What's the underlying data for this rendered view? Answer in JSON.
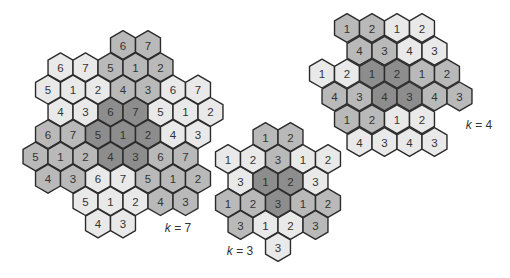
{
  "colors": {
    "light": "#e9e9e9",
    "medium": "#b9b9b9",
    "dark": "#8d8d8d",
    "stroke": "#2b2b2b",
    "text": "#333333"
  },
  "clusters": [
    {
      "id": "k7",
      "label": {
        "var": "k",
        "text": " = 7",
        "x": 178,
        "y": 228
      },
      "grid": {
        "x0": 48,
        "y0": 45,
        "dx": 25,
        "dy": 22.3
      },
      "rows": [
        {
          "c0": 3,
          "cells": [
            [
              "6",
              "medium"
            ],
            [
              "7",
              "medium"
            ]
          ]
        },
        {
          "c0": 0,
          "cells": [
            [
              "6",
              "light"
            ],
            [
              "7",
              "light"
            ],
            [
              "5",
              "medium"
            ],
            [
              "1",
              "medium"
            ],
            [
              "2",
              "medium"
            ]
          ]
        },
        {
          "c0": 0,
          "cells": [
            [
              "5",
              "light"
            ],
            [
              "1",
              "light"
            ],
            [
              "2",
              "light"
            ],
            [
              "4",
              "medium"
            ],
            [
              "3",
              "medium"
            ],
            [
              "6",
              "light"
            ],
            [
              "7",
              "light"
            ]
          ]
        },
        {
          "c0": 0,
          "cells": [
            [
              "4",
              "light"
            ],
            [
              "3",
              "light"
            ],
            [
              "6",
              "dark"
            ],
            [
              "7",
              "dark"
            ],
            [
              "5",
              "light"
            ],
            [
              "1",
              "light"
            ],
            [
              "2",
              "light"
            ]
          ]
        },
        {
          "c0": 0,
          "cells": [
            [
              "6",
              "medium"
            ],
            [
              "7",
              "medium"
            ],
            [
              "5",
              "dark"
            ],
            [
              "1",
              "dark"
            ],
            [
              "2",
              "dark"
            ],
            [
              "4",
              "light"
            ],
            [
              "3",
              "light"
            ]
          ]
        },
        {
          "c0": -1,
          "cells": [
            [
              "5",
              "medium"
            ],
            [
              "1",
              "medium"
            ],
            [
              "2",
              "medium"
            ],
            [
              "4",
              "dark"
            ],
            [
              "3",
              "dark"
            ],
            [
              "6",
              "medium"
            ],
            [
              "7",
              "medium"
            ]
          ]
        },
        {
          "c0": 0,
          "cells": [
            [
              "4",
              "medium"
            ],
            [
              "3",
              "medium"
            ],
            [
              "6",
              "light"
            ],
            [
              "7",
              "light"
            ],
            [
              "5",
              "medium"
            ],
            [
              "1",
              "medium"
            ],
            [
              "2",
              "medium"
            ]
          ]
        },
        {
          "c0": 1,
          "cells": [
            [
              "5",
              "light"
            ],
            [
              "1",
              "light"
            ],
            [
              "2",
              "light"
            ],
            [
              "4",
              "medium"
            ],
            [
              "3",
              "medium"
            ]
          ]
        },
        {
          "c0": 2,
          "cells": [
            [
              "4",
              "light"
            ],
            [
              "3",
              "light"
            ]
          ]
        }
      ]
    },
    {
      "id": "k3",
      "label": {
        "var": "k",
        "text": " = 3",
        "x": 240,
        "y": 251
      },
      "grid": {
        "x0": 228,
        "y0": 137,
        "dx": 25,
        "dy": 22
      },
      "rows": [
        {
          "c0": 1,
          "cells": [
            [
              "1",
              "medium"
            ],
            [
              "2",
              "medium"
            ]
          ]
        },
        {
          "c0": 0,
          "cells": [
            [
              "1",
              "light"
            ],
            [
              "2",
              "light"
            ],
            [
              "3",
              "medium"
            ],
            [
              "1",
              "light"
            ],
            [
              "2",
              "light"
            ]
          ]
        },
        {
          "c0": 0,
          "cells": [
            [
              "3",
              "light"
            ],
            [
              "1",
              "dark"
            ],
            [
              "2",
              "dark"
            ],
            [
              "3",
              "light"
            ]
          ]
        },
        {
          "c0": 0,
          "cells": [
            [
              "1",
              "medium"
            ],
            [
              "2",
              "medium"
            ],
            [
              "3",
              "dark"
            ],
            [
              "1",
              "medium"
            ],
            [
              "2",
              "medium"
            ]
          ]
        },
        {
          "c0": 0,
          "cells": [
            [
              "3",
              "medium"
            ],
            [
              "1",
              "light"
            ],
            [
              "2",
              "light"
            ],
            [
              "3",
              "medium"
            ]
          ]
        },
        {
          "c0": 2,
          "cells": [
            [
              "3",
              "light"
            ]
          ]
        }
      ],
      "odd_first": true
    },
    {
      "id": "k4",
      "label": {
        "var": "k",
        "text": " = 4",
        "x": 479,
        "y": 125
      },
      "grid": {
        "x0": 322,
        "y0": 28,
        "dx": 25,
        "dy": 22.8
      },
      "rows": [
        {
          "c0": 1,
          "cells": [
            [
              "1",
              "medium"
            ],
            [
              "2",
              "medium"
            ],
            [
              "1",
              "light"
            ],
            [
              "2",
              "light"
            ]
          ]
        },
        {
          "c0": 1,
          "cells": [
            [
              "4",
              "medium"
            ],
            [
              "3",
              "medium"
            ],
            [
              "4",
              "light"
            ],
            [
              "3",
              "light"
            ]
          ]
        },
        {
          "c0": 0,
          "cells": [
            [
              "1",
              "light"
            ],
            [
              "2",
              "light"
            ],
            [
              "1",
              "dark"
            ],
            [
              "2",
              "dark"
            ],
            [
              "1",
              "medium"
            ],
            [
              "2",
              "medium"
            ]
          ]
        },
        {
          "c0": 0,
          "cells": [
            [
              "4",
              "medium"
            ],
            [
              "3",
              "medium"
            ],
            [
              "4",
              "dark"
            ],
            [
              "3",
              "dark"
            ],
            [
              "4",
              "medium"
            ],
            [
              "3",
              "medium"
            ]
          ]
        },
        {
          "c0": 1,
          "cells": [
            [
              "1",
              "medium"
            ],
            [
              "2",
              "medium"
            ],
            [
              "1",
              "light"
            ],
            [
              "2",
              "light"
            ]
          ]
        },
        {
          "c0": 1,
          "cells": [
            [
              "4",
              "light"
            ],
            [
              "3",
              "light"
            ],
            [
              "4",
              "light"
            ],
            [
              "3",
              "light"
            ]
          ]
        }
      ]
    }
  ]
}
